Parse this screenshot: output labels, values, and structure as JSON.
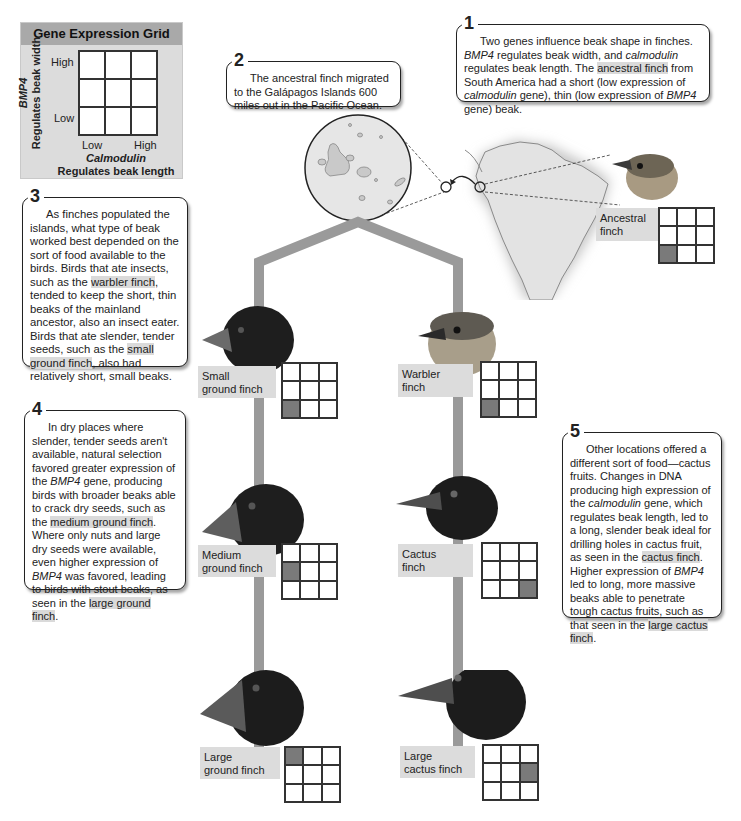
{
  "legend": {
    "title": "Gene Expression Grid",
    "y_gene": "BMP4",
    "y_desc": "Regulates beak width",
    "y_high": "High",
    "y_low": "Low",
    "x_gene": "Calmodulin",
    "x_desc": "Regulates beak length",
    "x_low": "Low",
    "x_high": "High"
  },
  "callouts": [
    {
      "num": "1",
      "parts": [
        "Two genes influence beak shape in finches. ",
        "BMP4",
        " regulates beak width, and ",
        "calmodulin",
        " regulates beak length. The ",
        "ancestral finch",
        " from South America had a short (low expression of ",
        "calmodulin",
        " gene), thin (low expression of ",
        "BMP4",
        " gene) beak."
      ]
    },
    {
      "num": "2",
      "text": "The ancestral finch migrated to the Galápagos Islands 600 miles out in the Pacific Ocean."
    },
    {
      "num": "3",
      "parts": [
        "As finches populated the islands, what type of beak worked best depended on the sort of food available to the birds. Birds that ate insects, such as the ",
        "warbler finch",
        ", tended to keep the short, thin beaks of the mainland ancestor, also an insect eater. Birds that ate slender, tender seeds, such as the ",
        "small ground finch",
        ", also had relatively short, small beaks."
      ]
    },
    {
      "num": "4",
      "parts": [
        "In dry places where slender, tender seeds aren't available, natural selection favored greater expression of the ",
        "BMP4",
        " gene, producing birds with broader beaks able to crack dry seeds, such as the ",
        "medium ground finch",
        ". Where only nuts and large dry seeds were available, even higher expression of ",
        "BMP4",
        " was favored, leading to birds with stout beaks, as seen in the ",
        "large ground finch",
        "."
      ]
    },
    {
      "num": "5",
      "parts": [
        "Other locations offered a different sort of food—cactus fruits. Changes in DNA producing high expression of the ",
        "calmodulin",
        " gene, which regulates beak length, led to a long, slender beak ideal for drilling holes in cactus fruit, as seen in the ",
        "cactus finch",
        ". Higher expression of ",
        "BMP4",
        " led to long, more massive beaks able to penetrate tough cactus fruits, such as that seen in the ",
        "large cactus finch",
        "."
      ]
    }
  ],
  "finches": [
    {
      "id": "ancestral",
      "label_line1": "Ancestral",
      "label_line2": "finch",
      "bmp4": "Low",
      "calmodulin": "Low",
      "cell": [
        2,
        0
      ],
      "color": "brown"
    },
    {
      "id": "small-ground",
      "label_line1": "Small",
      "label_line2": "ground finch",
      "bmp4": "Low",
      "calmodulin": "Low",
      "cell": [
        2,
        0
      ],
      "color": "black"
    },
    {
      "id": "warbler",
      "label_line1": "Warbler",
      "label_line2": "finch",
      "bmp4": "Low",
      "calmodulin": "Low",
      "cell": [
        2,
        0
      ],
      "color": "brown"
    },
    {
      "id": "medium-ground",
      "label_line1": "Medium",
      "label_line2": "ground finch",
      "bmp4": "Medium",
      "calmodulin": "Low",
      "cell": [
        1,
        0
      ],
      "color": "black"
    },
    {
      "id": "cactus",
      "label_line1": "Cactus",
      "label_line2": "finch",
      "bmp4": "Low",
      "calmodulin": "High",
      "cell": [
        2,
        2
      ],
      "color": "black"
    },
    {
      "id": "large-ground",
      "label_line1": "Large",
      "label_line2": "ground finch",
      "bmp4": "High",
      "calmodulin": "Low",
      "cell": [
        0,
        0
      ],
      "color": "black"
    },
    {
      "id": "large-cactus",
      "label_line1": "Large",
      "label_line2": "cactus finch",
      "bmp4": "Medium",
      "calmodulin": "High",
      "cell": [
        1,
        2
      ],
      "color": "black"
    }
  ],
  "colors": {
    "branch": "#9a9a9a",
    "highlight": "#dadada",
    "grid_on": "#7a7a7a",
    "label_bg": "#dcdcdc",
    "legend_bg": "#dcdcdc",
    "legend_title_bg": "#a9a9a9"
  }
}
